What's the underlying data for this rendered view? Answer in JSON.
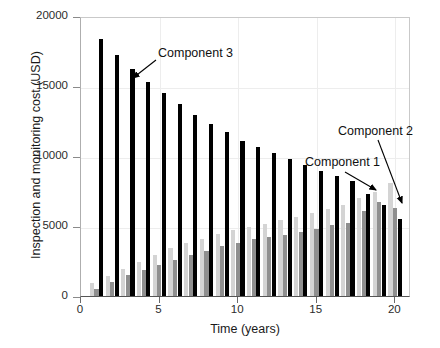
{
  "chart_data": {
    "type": "bar",
    "title": "",
    "xlabel": "Time (years)",
    "ylabel": "Inspection and monitoring cost (USD)",
    "xlim": [
      0,
      21
    ],
    "ylim": [
      0,
      20000
    ],
    "yticks": [
      0,
      5000,
      10000,
      15000,
      20000
    ],
    "ytick_labels": [
      "0",
      "5000",
      "10000",
      "15000",
      "20000"
    ],
    "xticks": [
      0,
      5,
      10,
      15,
      20
    ],
    "xtick_labels": [
      "0",
      "5",
      "10",
      "15",
      "20"
    ],
    "grid": true,
    "legend_position": "none",
    "categories": [
      1,
      2,
      3,
      4,
      5,
      6,
      7,
      8,
      9,
      10,
      11,
      12,
      13,
      14,
      15,
      16,
      17,
      18,
      19,
      20
    ],
    "series": [
      {
        "name": "Component 1",
        "color": "#d4d4d4",
        "values": [
          900,
          1450,
          1900,
          2400,
          2950,
          3400,
          3800,
          4100,
          4400,
          4700,
          4900,
          5150,
          5400,
          5650,
          5900,
          6200,
          6500,
          7000,
          7400,
          8050
        ]
      },
      {
        "name": "Component 2",
        "color": "#8f8f8f",
        "values": [
          500,
          1000,
          1500,
          1850,
          2250,
          2600,
          2950,
          3250,
          3550,
          3800,
          4050,
          4250,
          4350,
          4600,
          4800,
          5050,
          5250,
          6050,
          6700,
          6300
        ]
      },
      {
        "name": "Component 3",
        "color": "#000000",
        "values": [
          18350,
          17200,
          16200,
          15300,
          14500,
          13700,
          12950,
          12300,
          11700,
          11100,
          10650,
          10200,
          9800,
          9350,
          8950,
          8600,
          8250,
          7300,
          6500,
          5500
        ]
      }
    ],
    "annotations": [
      {
        "text": "Component 3",
        "points_to_series": "Component 3",
        "points_to_category": 4
      },
      {
        "text": "Component 1",
        "points_to_series": "Component 1",
        "points_to_category": 18
      },
      {
        "text": "Component 2",
        "points_to_series": "Component 2",
        "points_to_category": 19
      }
    ]
  },
  "axis": {
    "y_title": "Inspection and monitoring cost (USD)",
    "x_title": "Time (years)"
  },
  "annotations": {
    "c3": "Component 3",
    "c1": "Component 1",
    "c2": "Component 2"
  },
  "colors": {
    "component1": "#d4d4d4",
    "component2": "#8f8f8f",
    "component3": "#000000",
    "axis": "#555555",
    "grid": "#ededed",
    "text": "#1a1a1a"
  }
}
